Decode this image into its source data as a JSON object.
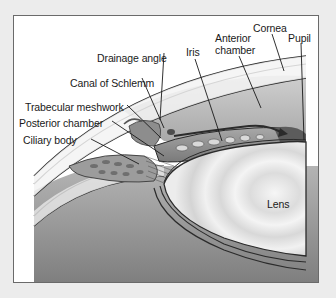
{
  "diagram": {
    "labels": {
      "drainage_angle": "Drainage angle",
      "canal_of_schlemm": "Canal of Schlemm",
      "trabecular_meshwork": "Trabecular meshwork",
      "posterior_chamber": "Posterior chamber",
      "ciliary_body": "Ciliary body",
      "iris": "Iris",
      "anterior_chamber_line1": "Anterior",
      "anterior_chamber_line2": "chamber",
      "cornea": "Cornea",
      "pupil": "Pupil",
      "lens": "Lens"
    },
    "colors": {
      "page_background": "#ececec",
      "frame_background": "#ffffff",
      "frame_border": "#6a6a6a",
      "outline": "#2b2b2b",
      "tissue_mid": "#9a9a9a",
      "tissue_dark": "#5a5a5a",
      "lens_light": "#f2f2f2",
      "vitreous_dark": "#8c8c8c"
    }
  }
}
